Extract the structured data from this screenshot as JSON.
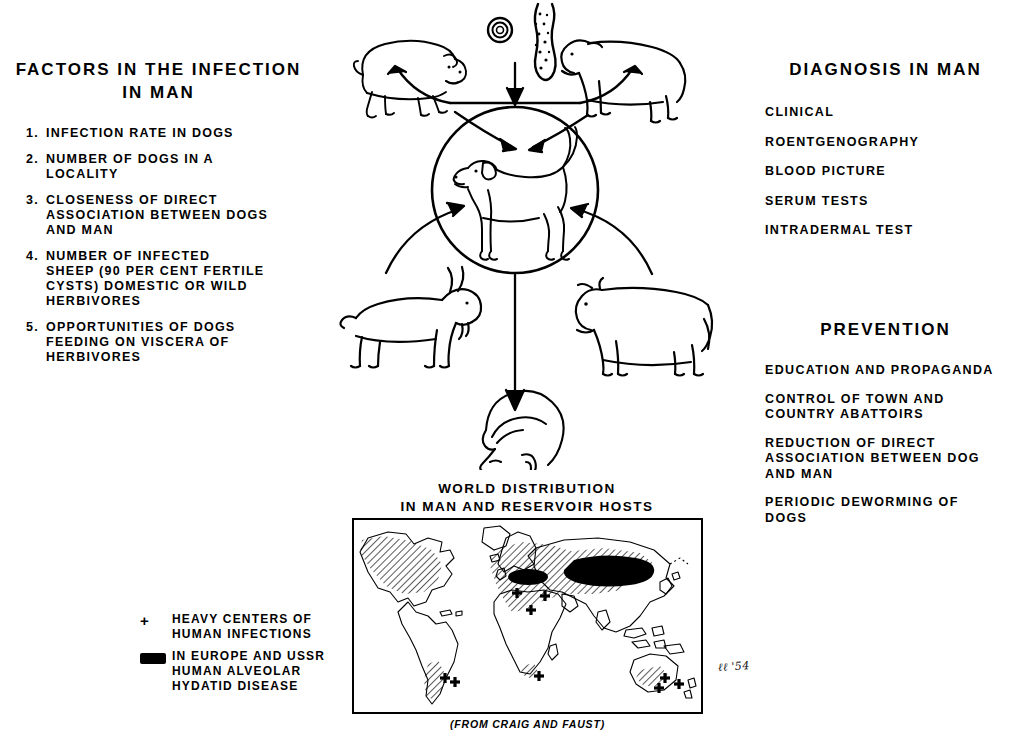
{
  "left_panel": {
    "heading": "FACTORS IN THE INFECTION\nIN MAN",
    "items": [
      {
        "num": "1.",
        "text": "INFECTION  RATE IN DOGS"
      },
      {
        "num": "2.",
        "text": "NUMBER  OF  DOGS IN A\nLOCALITY"
      },
      {
        "num": "3.",
        "text": "CLOSENESS  OF DIRECT\nASSOCIATION BETWEEN DOGS\nAND MAN"
      },
      {
        "num": "4.",
        "text": "NUMBER OF INFECTED\nSHEEP (90 PER CENT FERTILE\nCYSTS) DOMESTIC OR WILD\nHERBIVORES"
      },
      {
        "num": "5.",
        "text": "OPPORTUNITIES  OF DOGS\nFEEDING ON VISCERA OF\nHERBIVORES"
      }
    ]
  },
  "diagnosis_panel": {
    "heading": "DIAGNOSIS IN MAN",
    "items": [
      "CLINICAL",
      "ROENTGENOGRAPHY",
      "BLOOD PICTURE",
      "SERUM TESTS",
      "INTRADERMAL TEST"
    ]
  },
  "prevention_panel": {
    "heading": "PREVENTION",
    "items": [
      "EDUCATION AND PROPAGANDA",
      "CONTROL OF TOWN AND\nCOUNTRY ABATTOIRS",
      "REDUCTION OF DIRECT\nASSOCIATION BETWEEN DOG\nAND MAN",
      "PERIODIC DEWORMING OF\nDOGS"
    ]
  },
  "cycle": {
    "center_animal": "dog",
    "reservoir_hosts": [
      "pig",
      "sheep",
      "goat",
      "cow"
    ],
    "parasite_stages": [
      "egg",
      "tapeworm-larva"
    ],
    "terminal_host": "man"
  },
  "map": {
    "title": "WORLD DISTRIBUTION\nIN MAN AND RESERVOIR HOSTS",
    "credit": "(FROM CRAIG AND FAUST)",
    "signature": "ℓℓ '54",
    "legend": [
      {
        "key": "+",
        "key_type": "plus",
        "text": "HEAVY CENTERS OF\nHUMAN  INFECTIONS"
      },
      {
        "key": "",
        "key_type": "swatch",
        "text": "IN EUROPE AND USSR\nHUMAN ALVEOLAR\nHYDATID DISEASE"
      }
    ]
  },
  "colors": {
    "ink": "#000000",
    "background": "#ffffff"
  }
}
